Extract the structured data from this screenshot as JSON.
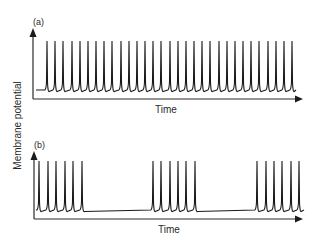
{
  "figure": {
    "ylabel": "Membrane potential",
    "panels": [
      {
        "label": "(a)",
        "xlabel": "Time"
      },
      {
        "label": "(b)",
        "xlabel": "Time"
      }
    ]
  },
  "colors": {
    "trace": "#1a1a1a",
    "axis": "#2a2a2a",
    "background": "#ffffff"
  },
  "chart_data": [
    {
      "type": "line",
      "title": "(a)",
      "description": "Tonic (regular) spiking: continuous train of evenly spaced action potentials",
      "xlabel": "Time",
      "ylabel": "Membrane potential",
      "grid": false,
      "ticks": "none",
      "spike_count": 31,
      "spike_times_px": [
        47,
        55,
        63,
        72,
        80,
        88,
        96,
        104,
        112,
        121,
        129,
        137,
        145,
        153,
        161,
        170,
        178,
        186,
        194,
        202,
        210,
        219,
        227,
        235,
        243,
        251,
        259,
        268,
        276,
        284,
        292
      ],
      "pattern": "regular"
    },
    {
      "type": "line",
      "title": "(b)",
      "description": "Bursting: groups of 6 spikes separated by quiescent intervals",
      "xlabel": "Time",
      "ylabel": "Membrane potential",
      "grid": false,
      "ticks": "none",
      "bursts": [
        {
          "spikes": 6,
          "spike_times_px": [
            39,
            48,
            56,
            65,
            73,
            82
          ]
        },
        {
          "spikes": 6,
          "spike_times_px": [
            153,
            161,
            170,
            178,
            186,
            195
          ]
        },
        {
          "spikes": 6,
          "spike_times_px": [
            257,
            266,
            274,
            282,
            291,
            299
          ]
        }
      ],
      "pattern": "burst"
    }
  ]
}
